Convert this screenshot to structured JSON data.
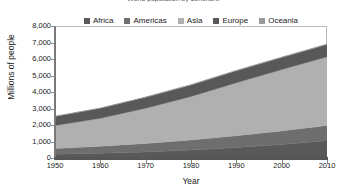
{
  "chart_data": {
    "type": "area",
    "stacked": true,
    "title": "World population by continent",
    "xlabel": "Year",
    "ylabel": "Millions of people",
    "x": [
      1950,
      1960,
      1970,
      1980,
      1990,
      2000,
      2010
    ],
    "xlim": [
      1950,
      2010
    ],
    "ylim": [
      0,
      8000
    ],
    "xticks": [
      1950,
      1960,
      1970,
      1980,
      1990,
      2000,
      2010
    ],
    "xtick_labels": [
      "1950",
      "1960",
      "1970",
      "1980",
      "1990",
      "2000",
      "2010"
    ],
    "yticks": [
      0,
      1000,
      2000,
      3000,
      4000,
      5000,
      6000,
      7000,
      8000
    ],
    "ytick_labels": [
      "0",
      "1,000",
      "2,000",
      "3,000",
      "4,000",
      "5,000",
      "6,000",
      "7,000",
      "8,000"
    ],
    "grid": false,
    "legend_position": "top-center",
    "series": [
      {
        "name": "Africa",
        "color": "#595959",
        "values": [
          229,
          285,
          366,
          478,
          632,
          814,
          1039
        ]
      },
      {
        "name": "Americas",
        "color": "#6e6e6e",
        "values": [
          340,
          424,
          519,
          617,
          721,
          829,
          934
        ]
      },
      {
        "name": "Asia",
        "color": "#b0b0b0",
        "values": [
          1404,
          1700,
          2135,
          2635,
          3210,
          3717,
          4165
        ]
      },
      {
        "name": "Europe",
        "color": "#585858",
        "values": [
          549,
          605,
          657,
          694,
          721,
          727,
          738
        ]
      },
      {
        "name": "Oceania",
        "color": "#9a9a9a",
        "values": [
          13,
          16,
          20,
          23,
          27,
          31,
          37
        ]
      }
    ],
    "totals": [
      2536,
      3030,
      3697,
      4447,
      5311,
      6118,
      6913
    ]
  },
  "legend": {
    "items": [
      {
        "label": "Africa"
      },
      {
        "label": "Americas"
      },
      {
        "label": "Asia"
      },
      {
        "label": "Europe"
      },
      {
        "label": "Oceania"
      }
    ]
  }
}
